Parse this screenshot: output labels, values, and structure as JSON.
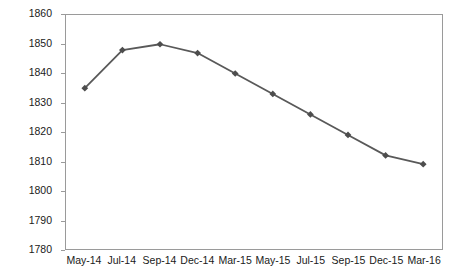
{
  "chart_data": {
    "type": "line",
    "title": "",
    "xlabel": "",
    "ylabel": "Prices in - £ /Tonne",
    "categories": [
      "May-14",
      "Jul-14",
      "Sep-14",
      "Dec-14",
      "Mar-15",
      "May-15",
      "Jul-15",
      "Sep-15",
      "Dec-15",
      "Mar-16"
    ],
    "values": [
      1835,
      1848,
      1850,
      1847,
      1840,
      1833,
      1826,
      1819,
      1812,
      1809
    ],
    "series": [
      {
        "name": "Prices",
        "values": [
          1835,
          1848,
          1850,
          1847,
          1840,
          1833,
          1826,
          1819,
          1812,
          1809
        ]
      }
    ],
    "ylim": [
      1780,
      1860
    ],
    "yticks": [
      1860,
      1850,
      1840,
      1830,
      1820,
      1810,
      1800,
      1790,
      1780
    ],
    "ytick_labels": [
      "1860",
      "1850",
      "1840",
      "1830",
      "1820",
      "1810",
      "1800",
      "1790",
      "1780"
    ],
    "grid": false,
    "legend": false,
    "legend_position": "none",
    "marker": "diamond",
    "line_color": "#595959",
    "marker_color": "#4d4d4d",
    "axis_color": "#9a9a9a",
    "background_color": "#ffffff"
  }
}
